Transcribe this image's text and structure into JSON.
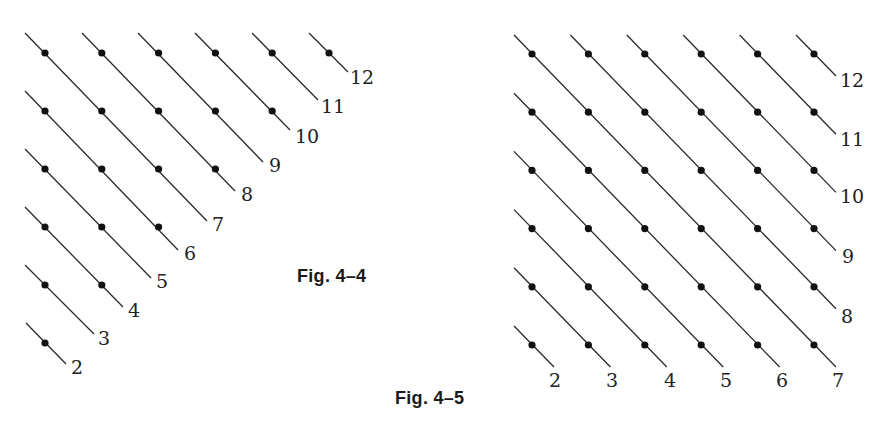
{
  "figures": [
    {
      "id": "fig-4-4",
      "caption": "Fig. 4–4",
      "shape": "triangle",
      "description": "Triangular array of points (row r has 6-r points) with descending diagonal lines labeled 2 through 12",
      "grid": {
        "rows": 6,
        "cols": 6,
        "x0": 45,
        "dx": 56.8,
        "y0": 53,
        "dy": 58
      },
      "lines": [
        {
          "label": "12",
          "dots": [
            [
              0,
              5
            ]
          ],
          "start": [
            309,
            33
          ],
          "end": [
            348,
            72
          ],
          "label_pos": [
            362,
            84
          ]
        },
        {
          "label": "11",
          "dots": [
            [
              0,
              4
            ]
          ],
          "start": [
            252,
            33
          ],
          "end": [
            318,
            100
          ],
          "label_pos": [
            333,
            113
          ]
        },
        {
          "label": "10",
          "dots": [
            [
              0,
              3
            ],
            [
              1,
              4
            ]
          ],
          "start": [
            195,
            33
          ],
          "end": [
            290,
            130
          ],
          "label_pos": [
            307,
            143
          ]
        },
        {
          "label": "9",
          "dots": [
            [
              0,
              2
            ],
            [
              1,
              3
            ]
          ],
          "start": [
            138,
            33
          ],
          "end": [
            263,
            162
          ],
          "label_pos": [
            275,
            172
          ]
        },
        {
          "label": "8",
          "dots": [
            [
              0,
              1
            ],
            [
              1,
              2
            ],
            [
              2,
              3
            ]
          ],
          "start": [
            82,
            33
          ],
          "end": [
            235,
            191
          ],
          "label_pos": [
            247,
            201
          ]
        },
        {
          "label": "7",
          "dots": [
            [
              0,
              0
            ],
            [
              1,
              1
            ],
            [
              2,
              2
            ]
          ],
          "start": [
            25,
            33
          ],
          "end": [
            207,
            221
          ],
          "label_pos": [
            218,
            231
          ]
        },
        {
          "label": "6",
          "dots": [
            [
              1,
              0
            ],
            [
              2,
              1
            ],
            [
              3,
              2
            ]
          ],
          "start": [
            25,
            91
          ],
          "end": [
            178,
            250
          ],
          "label_pos": [
            190,
            260
          ]
        },
        {
          "label": "5",
          "dots": [
            [
              2,
              0
            ],
            [
              3,
              1
            ]
          ],
          "start": [
            25,
            149
          ],
          "end": [
            151,
            278
          ],
          "label_pos": [
            162,
            288
          ]
        },
        {
          "label": "4",
          "dots": [
            [
              3,
              0
            ],
            [
              4,
              1
            ]
          ],
          "start": [
            25,
            207
          ],
          "end": [
            123,
            307
          ],
          "label_pos": [
            134,
            317
          ]
        },
        {
          "label": "3",
          "dots": [
            [
              4,
              0
            ]
          ],
          "start": [
            25,
            265
          ],
          "end": [
            94,
            334
          ],
          "label_pos": [
            104,
            345
          ]
        },
        {
          "label": "2",
          "dots": [
            [
              5,
              0
            ]
          ],
          "start": [
            26,
            323
          ],
          "end": [
            66,
            364
          ],
          "label_pos": [
            77,
            374
          ]
        }
      ]
    },
    {
      "id": "fig-4-5",
      "caption": "Fig. 4–5",
      "shape": "square",
      "description": "Full 6×6 array of points with descending diagonal lines labeled 2 through 12",
      "grid": {
        "rows": 6,
        "cols": 6,
        "x0": 532,
        "dx": 56.4,
        "y0": 54,
        "dy": 58.2
      },
      "lines": [
        {
          "label": "12",
          "first": [
            0,
            5
          ],
          "last": [
            0,
            5
          ],
          "label_pos": [
            852,
            87
          ]
        },
        {
          "label": "11",
          "first": [
            0,
            4
          ],
          "last": [
            1,
            5
          ],
          "label_pos": [
            852,
            146
          ]
        },
        {
          "label": "10",
          "first": [
            0,
            3
          ],
          "last": [
            2,
            5
          ],
          "label_pos": [
            852,
            203
          ]
        },
        {
          "label": "9",
          "first": [
            0,
            2
          ],
          "last": [
            3,
            5
          ],
          "label_pos": [
            848,
            263
          ]
        },
        {
          "label": "8",
          "first": [
            0,
            1
          ],
          "last": [
            4,
            5
          ],
          "label_pos": [
            847,
            323
          ]
        },
        {
          "label": "7",
          "first": [
            0,
            0
          ],
          "last": [
            5,
            5
          ],
          "label_pos": [
            838,
            387
          ]
        },
        {
          "label": "6",
          "first": [
            1,
            0
          ],
          "last": [
            5,
            4
          ],
          "label_pos": [
            782,
            387
          ]
        },
        {
          "label": "5",
          "first": [
            2,
            0
          ],
          "last": [
            5,
            3
          ],
          "label_pos": [
            726,
            387
          ]
        },
        {
          "label": "4",
          "first": [
            3,
            0
          ],
          "last": [
            5,
            2
          ],
          "label_pos": [
            670,
            387
          ]
        },
        {
          "label": "3",
          "first": [
            4,
            0
          ],
          "last": [
            5,
            1
          ],
          "label_pos": [
            612,
            387
          ]
        },
        {
          "label": "2",
          "first": [
            5,
            0
          ],
          "last": [
            5,
            0
          ],
          "label_pos": [
            555,
            387
          ]
        }
      ],
      "start_offset": [
        -18,
        -19
      ],
      "end_offset": [
        22,
        22
      ]
    }
  ],
  "style": {
    "line_color": "#2a2a2a",
    "dot_color": "#111111",
    "dot_radius": 3.6,
    "line_width": 1.3
  }
}
